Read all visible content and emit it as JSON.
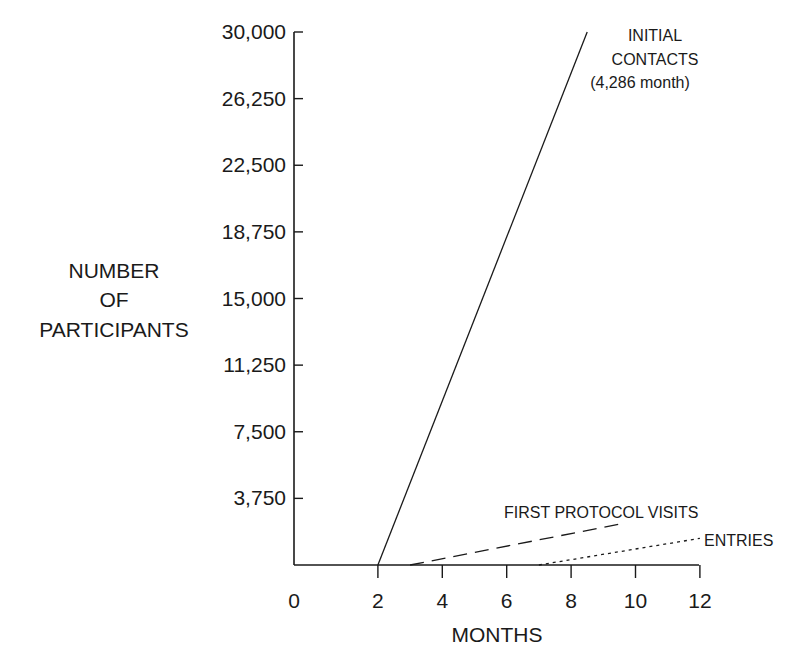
{
  "chart_data": {
    "type": "line",
    "title": "",
    "xlabel": "MONTHS",
    "ylabel": "NUMBER OF PARTICIPANTS",
    "ylabel_lines": [
      "NUMBER",
      "OF",
      "PARTICIPANTS"
    ],
    "x_ticks": [
      0,
      2,
      4,
      6,
      8,
      10,
      12
    ],
    "x_tick_labels": [
      "0",
      "2",
      "4",
      "6",
      "8",
      "10",
      "12"
    ],
    "y_ticks": [
      3750,
      7500,
      11250,
      15000,
      18750,
      22500,
      26250,
      30000
    ],
    "y_tick_labels": [
      "3,750",
      "7,500",
      "11,250",
      "15,000",
      "18,750",
      "22,500",
      "26,250",
      "30,000"
    ],
    "xlim": [
      0,
      12
    ],
    "ylim": [
      0,
      30000
    ],
    "grid": false,
    "legend": "inline annotations at line ends",
    "series": [
      {
        "name": "INITIAL CONTACTS",
        "label_lines": [
          "INITIAL",
          "CONTACTS",
          "(4,286 month)"
        ],
        "style": "solid",
        "x": [
          2,
          8.5
        ],
        "y": [
          0,
          30000
        ]
      },
      {
        "name": "FIRST PROTOCOL VISITS",
        "label_lines": [
          "FIRST PROTOCOL VISITS"
        ],
        "style": "dashed",
        "x": [
          3,
          9.5
        ],
        "y": [
          0,
          2300
        ]
      },
      {
        "name": "ENTRIES",
        "label_lines": [
          "ENTRIES"
        ],
        "style": "dotted",
        "x": [
          7,
          12
        ],
        "y": [
          0,
          1500
        ]
      }
    ],
    "annotations": [
      "INITIAL CONTACTS (4,286 month)",
      "FIRST PROTOCOL VISITS",
      "ENTRIES"
    ]
  },
  "colors": {
    "ink": "#1a1a1a",
    "background": "#ffffff"
  }
}
